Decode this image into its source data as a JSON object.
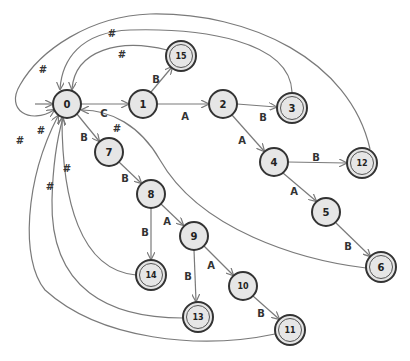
{
  "diagram": {
    "type": "finite-state-automaton",
    "start_state": "0",
    "states": [
      {
        "id": "0",
        "label": "0",
        "x": 67,
        "y": 104,
        "accepting": false
      },
      {
        "id": "1",
        "label": "1",
        "x": 143,
        "y": 104,
        "accepting": false
      },
      {
        "id": "2",
        "label": "2",
        "x": 223,
        "y": 104,
        "accepting": false
      },
      {
        "id": "3",
        "label": "3",
        "x": 292,
        "y": 108,
        "accepting": true
      },
      {
        "id": "4",
        "label": "4",
        "x": 274,
        "y": 162,
        "accepting": false
      },
      {
        "id": "5",
        "label": "5",
        "x": 326,
        "y": 212,
        "accepting": false
      },
      {
        "id": "6",
        "label": "6",
        "x": 381,
        "y": 267,
        "accepting": true
      },
      {
        "id": "7",
        "label": "7",
        "x": 109,
        "y": 152,
        "accepting": false
      },
      {
        "id": "8",
        "label": "8",
        "x": 151,
        "y": 194,
        "accepting": false
      },
      {
        "id": "9",
        "label": "9",
        "x": 194,
        "y": 236,
        "accepting": false
      },
      {
        "id": "10",
        "label": "10",
        "x": 243,
        "y": 286,
        "accepting": false
      },
      {
        "id": "11",
        "label": "11",
        "x": 290,
        "y": 330,
        "accepting": true
      },
      {
        "id": "12",
        "label": "12",
        "x": 362,
        "y": 163,
        "accepting": true
      },
      {
        "id": "13",
        "label": "13",
        "x": 198,
        "y": 317,
        "accepting": true
      },
      {
        "id": "14",
        "label": "14",
        "x": 151,
        "y": 275,
        "accepting": true
      },
      {
        "id": "15",
        "label": "15",
        "x": 181,
        "y": 56,
        "accepting": true
      }
    ],
    "transitions": [
      {
        "from": "0",
        "to": "1",
        "label": "C"
      },
      {
        "from": "1",
        "to": "15",
        "label": "B"
      },
      {
        "from": "1",
        "to": "2",
        "label": "A"
      },
      {
        "from": "2",
        "to": "3",
        "label": "B"
      },
      {
        "from": "2",
        "to": "4",
        "label": "A"
      },
      {
        "from": "4",
        "to": "12",
        "label": "B"
      },
      {
        "from": "4",
        "to": "5",
        "label": "A"
      },
      {
        "from": "5",
        "to": "6",
        "label": "B"
      },
      {
        "from": "0",
        "to": "7",
        "label": "B"
      },
      {
        "from": "7",
        "to": "8",
        "label": "B"
      },
      {
        "from": "8",
        "to": "14",
        "label": "B"
      },
      {
        "from": "8",
        "to": "9",
        "label": "A"
      },
      {
        "from": "9",
        "to": "13",
        "label": "B"
      },
      {
        "from": "9",
        "to": "10",
        "label": "A"
      },
      {
        "from": "10",
        "to": "11",
        "label": "B"
      },
      {
        "from": "15",
        "to": "0",
        "label": "#"
      },
      {
        "from": "3",
        "to": "0",
        "label": "#"
      },
      {
        "from": "12",
        "to": "0",
        "label": "#"
      },
      {
        "from": "0",
        "to": "0",
        "label": "#"
      },
      {
        "from": "6",
        "to": "0",
        "label": "#"
      },
      {
        "from": "14",
        "to": "0",
        "label": "#"
      },
      {
        "from": "13",
        "to": "0",
        "label": "#"
      },
      {
        "from": "11",
        "to": "0",
        "label": "#"
      }
    ]
  },
  "labels": {
    "n0": "0",
    "n1": "1",
    "n2": "2",
    "n3": "3",
    "n4": "4",
    "n5": "5",
    "n6": "6",
    "n7": "7",
    "n8": "8",
    "n9": "9",
    "n10": "10",
    "n11": "11",
    "n12": "12",
    "n13": "13",
    "n14": "14",
    "n15": "15",
    "e_0_1": "C",
    "e_1_15": "B",
    "e_1_2": "A",
    "e_2_3": "B",
    "e_2_4": "A",
    "e_4_12": "B",
    "e_4_5": "A",
    "e_5_6": "B",
    "e_0_7": "B",
    "e_7_8": "B",
    "e_8_14": "B",
    "e_8_9": "A",
    "e_9_13": "B",
    "e_9_10": "A",
    "e_10_11": "B",
    "e_15_0": "#",
    "e_3_0": "#",
    "e_12_0": "#",
    "e_0_0": "#",
    "e_6_0": "#",
    "e_14_0": "#",
    "e_13_0": "#",
    "e_11_0": "#"
  }
}
